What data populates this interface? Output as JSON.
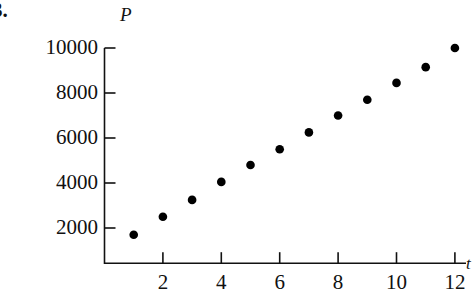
{
  "problem": {
    "number": "3."
  },
  "axes": {
    "y_label": "P",
    "x_label": "t",
    "y_ticks": [
      "2000",
      "4000",
      "6000",
      "8000",
      "10000"
    ],
    "x_ticks": [
      "2",
      "4",
      "6",
      "8",
      "10",
      "12"
    ]
  },
  "colors": {
    "axis": "#111111",
    "marker": "#000000",
    "background": "#ffffff"
  },
  "chart_data": {
    "type": "scatter",
    "title": "",
    "xlabel": "t",
    "ylabel": "P",
    "xlim": [
      0,
      12.6
    ],
    "ylim": [
      0,
      10600
    ],
    "grid": false,
    "legend": "none",
    "x": [
      1,
      2,
      3,
      4,
      5,
      6,
      7,
      8,
      9,
      10,
      11,
      12
    ],
    "values": [
      1700,
      2500,
      3250,
      4050,
      4800,
      5500,
      6250,
      7000,
      7700,
      8450,
      9150,
      10000
    ],
    "x_tick_values": [
      2,
      4,
      6,
      8,
      10,
      12
    ],
    "y_tick_values": [
      2000,
      4000,
      6000,
      8000,
      10000
    ],
    "marker": "filled-circle",
    "marker_size": 6
  }
}
